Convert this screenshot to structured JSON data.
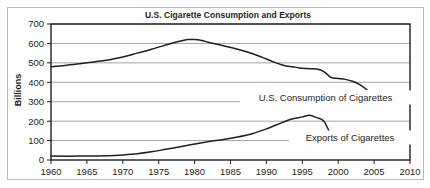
{
  "chart_data": {
    "type": "line",
    "title": "U.S. Cigarette Consumption and Exports",
    "xlabel": "",
    "ylabel": "Billions",
    "xlim": [
      1960,
      2010
    ],
    "ylim": [
      0,
      700
    ],
    "grid": "horizontal",
    "legend_position": "inline-right",
    "xticks": [
      "1960",
      "1965",
      "1970",
      "1975",
      "1980",
      "1985",
      "1990",
      "1995",
      "2000",
      "2005",
      "2010"
    ],
    "yticks": [
      "0",
      "100",
      "200",
      "300",
      "400",
      "500",
      "600",
      "700"
    ],
    "series": [
      {
        "name": "U.S.  Consumption of Cigarettes",
        "color": "#231f20",
        "x": [
          1960,
          1962,
          1964,
          1966,
          1968,
          1970,
          1972,
          1974,
          1976,
          1978,
          1979,
          1980,
          1981,
          1982,
          1984,
          1986,
          1988,
          1990,
          1991,
          1992,
          1993,
          1994,
          1995,
          1996,
          1997,
          1998,
          1999,
          2000,
          2001,
          2002,
          2003,
          2004
        ],
        "values": [
          480,
          487,
          495,
          505,
          515,
          530,
          550,
          570,
          592,
          612,
          620,
          620,
          615,
          605,
          588,
          570,
          548,
          520,
          505,
          492,
          482,
          478,
          472,
          470,
          468,
          455,
          425,
          420,
          415,
          405,
          388,
          362
        ]
      },
      {
        "name": "Exports of Cigarettes",
        "color": "#231f20",
        "x": [
          1960,
          1964,
          1968,
          1970,
          1972,
          1974,
          1976,
          1978,
          1980,
          1982,
          1984,
          1986,
          1988,
          1990,
          1992,
          1993,
          1994,
          1995,
          1996,
          1997,
          1998,
          1999,
          2000,
          2001,
          2002,
          2003,
          2004,
          2005
        ],
        "values": [
          20,
          20,
          22,
          26,
          32,
          42,
          55,
          68,
          82,
          95,
          105,
          118,
          135,
          160,
          190,
          205,
          215,
          222,
          230,
          218,
          200,
          135,
          133,
          127,
          118,
          108,
          98,
          95
        ]
      }
    ],
    "annotations": [
      {
        "text": "U.S.  Consumption of Cigarettes",
        "series": 0
      },
      {
        "text": "Exports of Cigarettes",
        "series": 1
      }
    ]
  }
}
